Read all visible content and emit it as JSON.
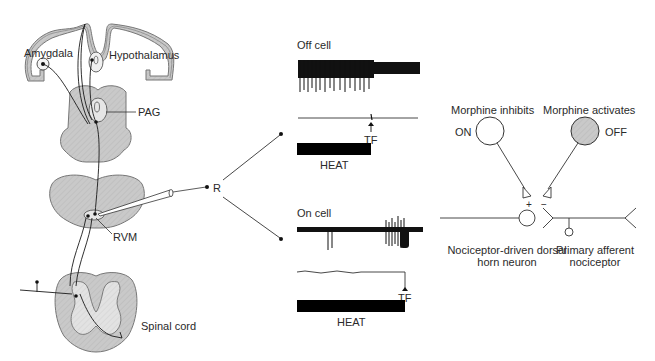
{
  "anatomy": {
    "amygdala": "Amygdala",
    "hypothalamus": "Hypothalamus",
    "pag": "PAG",
    "rvm": "RVM",
    "spinal_cord": "Spinal cord",
    "recording": "R"
  },
  "off_cell": {
    "title": "Off cell",
    "marker": "TF",
    "stimulus": "HEAT"
  },
  "on_cell": {
    "title": "On cell",
    "marker": "TF",
    "stimulus": "HEAT"
  },
  "circuit": {
    "on_caption": "Morphine inhibits",
    "on_label": "ON",
    "off_caption": "Morphine activates",
    "off_label": "OFF",
    "plus": "+",
    "minus": "−",
    "dorsal_horn_line1": "Nociceptor-driven dorsal",
    "dorsal_horn_line2": "horn neuron",
    "afferent_line1": "Primary afferent",
    "afferent_line2": "nociceptor"
  },
  "colors": {
    "tissue_fill": "#c8c8c8",
    "tissue_stroke": "#6e6e6e",
    "ink": "#1a1a1a",
    "off_neuron_fill": "#cfcfcf"
  }
}
